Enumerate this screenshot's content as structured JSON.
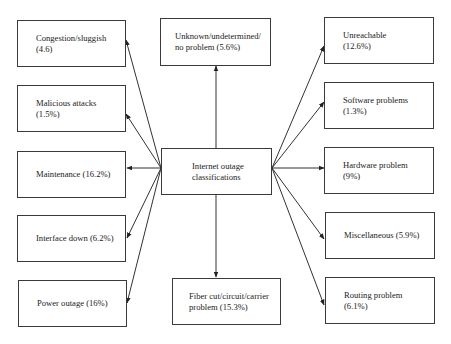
{
  "diagram": {
    "title": "Internet outage classifications",
    "hub": {
      "label": "Internet outage\nclassifications"
    },
    "left": [
      {
        "label": "Congestion/sluggish\n(4.6)"
      },
      {
        "label": "Malicious attacks\n(1.5%)"
      },
      {
        "label": "Maintenance (16.2%)"
      },
      {
        "label": "Interface down (6.2%)"
      },
      {
        "label": "Power outage (16%)"
      }
    ],
    "top": {
      "label": "Unknown/undetermined/\nno problem (5.6%)"
    },
    "bottom": {
      "label": "Fiber cut/circuit/carrier\nproblem (15.3%)"
    },
    "right": [
      {
        "label": "Unreachable\n(12.6%)"
      },
      {
        "label": "Software problems\n(1.3%)"
      },
      {
        "label": "Hardware problem\n(9%)"
      },
      {
        "label": "Miscellaneous (5.9%)"
      },
      {
        "label": "Routing problem\n(6.1%)"
      }
    ],
    "colors": {
      "line": "#333333",
      "border": "#3a3a3a",
      "background": "#ffffff"
    }
  }
}
